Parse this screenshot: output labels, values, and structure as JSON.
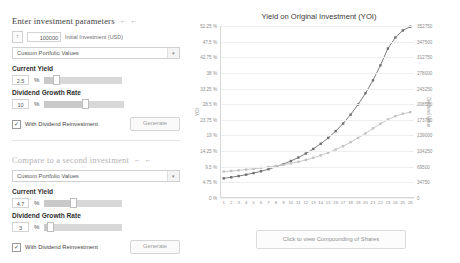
{
  "primary_panel": {
    "heading": "Enter investment parameters",
    "arrows": "← ←",
    "initial_investment_value": "100000",
    "initial_investment_label": "Initial Investment (USD)",
    "portfolio_select_value": "Custom Portfolio Values",
    "current_yield_title": "Current Yield",
    "current_yield_value": "2.5",
    "percent_symbol": "%",
    "growth_rate_title": "Dividend Growth Rate",
    "growth_rate_value": "10",
    "reinvest_label": "With Dividend Reinvestment",
    "reinvest_checked": "✓",
    "generate_label": "Generate"
  },
  "secondary_panel": {
    "heading": "Compare to a second investment",
    "arrows": "← ←",
    "portfolio_select_value": "Custom Portfolio Values",
    "current_yield_title": "Current Yield",
    "current_yield_value": "4.7",
    "percent_symbol": "%",
    "growth_rate_title": "Dividend Growth Rate",
    "growth_rate_value": "3",
    "reinvest_label": "With Dividend Reinvestment",
    "reinvest_checked": "✓",
    "generate_label": "Generate"
  },
  "footer": {
    "compounding_button": "Click to view Compounding of Shares"
  },
  "chart_data": {
    "type": "line",
    "title": "Yield on Original Investment (YOI)",
    "xlabel": "",
    "ylabel": "YOI",
    "y2label": "Dividend Value",
    "grid": true,
    "legend": "none",
    "x": [
      1,
      2,
      3,
      4,
      5,
      6,
      7,
      8,
      9,
      10,
      11,
      12,
      13,
      14,
      15,
      16,
      17,
      18,
      19,
      20,
      21,
      22,
      23,
      24,
      25,
      26
    ],
    "ylim": [
      0,
      52.25
    ],
    "yticks": [
      "0 %",
      "4.75 %",
      "9.5 %",
      "14.25 %",
      "19 %",
      "23.75 %",
      "28.5 %",
      "33.25 %",
      "38 %",
      "42.75 %",
      "47.5 %",
      "52.25 %"
    ],
    "y2lim": [
      0,
      352750
    ],
    "y2ticks": [
      "0",
      "34750",
      "69500",
      "104250",
      "139000",
      "173750",
      "208500",
      "243250",
      "278000",
      "312750",
      "347500",
      "352750"
    ],
    "series": [
      {
        "name": "Investment 1 (2.5% yield, 10% growth, reinvested)",
        "color": "#6f6f6f",
        "values": [
          2.5,
          2.85,
          3.25,
          3.7,
          4.22,
          4.82,
          5.5,
          6.27,
          7.15,
          8.16,
          9.3,
          10.6,
          12.1,
          13.8,
          15.7,
          17.9,
          20.4,
          23.3,
          26.6,
          30.3,
          34.5,
          39.4,
          44.9,
          48.5,
          50.8,
          52.0
        ]
      },
      {
        "name": "Investment 2 (4.7% yield, 3% growth, reinvested)",
        "color": "#c2c2c2",
        "values": [
          4.7,
          4.9,
          5.1,
          5.35,
          5.6,
          5.9,
          6.2,
          6.55,
          6.95,
          7.4,
          7.9,
          8.5,
          9.2,
          10.0,
          10.9,
          11.9,
          13.0,
          14.3,
          15.7,
          17.2,
          18.8,
          20.3,
          21.7,
          22.8,
          23.6,
          24.1
        ]
      }
    ]
  }
}
